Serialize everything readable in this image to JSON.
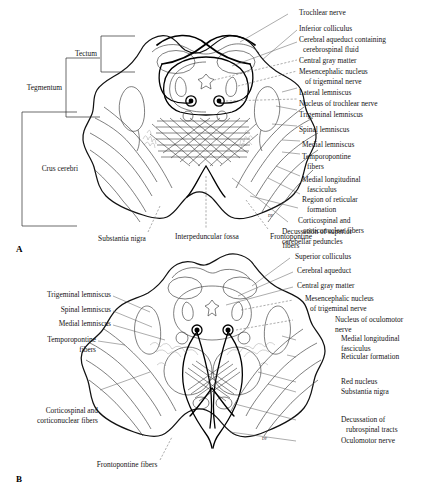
{
  "figure": {
    "panels": [
      {
        "marker": "A",
        "caption": "Midbrain at the level of the inferior colliculus",
        "brackets": [
          {
            "name": "tectum",
            "label": "Tectum"
          },
          {
            "name": "tegmentum",
            "label": "Tegmentum"
          },
          {
            "name": "crus-cerebri",
            "label": "Crus cerebri"
          }
        ],
        "labels_right": [
          "Trochlear nerve",
          "Inferior colliculus",
          "Cerebral aqueduct containing",
          "cerebrospinal fluid",
          "Central gray matter",
          "Mesencephalic nucleus",
          "of trigeminal nerve",
          "Lateral lemniscus",
          "Nucleus of trochlear nerve",
          "Trigeminal lemniscus",
          "Spinal lemniscus",
          "Medial lemniscus",
          "Temporopontine",
          "fibers",
          "Medial longitudinal",
          "fasciculus",
          "Region of reticular",
          "formation",
          "Corticospinal and",
          "corticonuclear fibers",
          "Decussation of superior",
          "cerebellar peduncles"
        ],
        "labels_bottom": [
          "Substantia nigra",
          "Interpeduncular fossa",
          "Frontopontine",
          "fibers"
        ],
        "inline_abbrev": "DF"
      },
      {
        "marker": "B",
        "caption": "Midbrain at the level of the superior colliculus",
        "labels_left": [
          "Trigeminal lemniscus",
          "Spinal lemniscus",
          "Medial lemniscus",
          "Temporopontine",
          "fibers",
          "Corticospinal and",
          "corticonuclear fibers"
        ],
        "labels_right": [
          "Superior colliculus",
          "Cerebral aqueduct",
          "Central gray matter",
          "Mesencephalic nucleus",
          "of trigeminal nerve",
          "Nucleus of oculomotor",
          "nerve",
          "Medial longitudinal",
          "fasciculus",
          "Reticular formation",
          "Red nucleus",
          "Substantia nigra",
          "Decussation of",
          "rubrospinal tracts",
          "Oculomotor nerve"
        ],
        "labels_bottom": [
          "Frontopontine fibers"
        ],
        "inline_abbrev": "DF"
      }
    ],
    "colors": {
      "ink": "#111111",
      "leader": "#5a5a5a",
      "page": "#ffffff",
      "reticular": "#9a9a9a"
    }
  },
  "panel_a": {
    "marker": "A",
    "bracket_tectum": "Tectum",
    "bracket_tegmentum": "Tegmentum",
    "bracket_crus": "Crus cerebri",
    "r1": "Trochlear nerve",
    "r2": "Inferior colliculus",
    "r3a": "Cerebral aqueduct containing",
    "r3b": "cerebrospinal fluid",
    "r4": "Central gray matter",
    "r5a": "Mesencephalic nucleus",
    "r5b": "of trigeminal nerve",
    "r6": "Lateral lemniscus",
    "r7": "Nucleus of trochlear nerve",
    "r8": "Trigeminal lemniscus",
    "r9": "Spinal lemniscus",
    "r10": "Medial lemniscus",
    "r11a": "Temporopontine",
    "r11b": "fibers",
    "r12a": "Medial longitudinal",
    "r12b": "fasciculus",
    "r13a": "Region of reticular",
    "r13b": "formation",
    "r14a": "Corticospinal and",
    "r14b": "corticonuclear fibers",
    "r15a": "Decussation of superior",
    "r15b": "cerebellar peduncles",
    "b1": "Substantia nigra",
    "b2": "Interpeduncular fossa",
    "b3a": "Frontopontine",
    "b3b": "fibers",
    "df": "DF"
  },
  "panel_b": {
    "marker": "B",
    "l1": "Trigeminal lemniscus",
    "l2": "Spinal lemniscus",
    "l3": "Medial lemniscus",
    "l4a": "Temporopontine",
    "l4b": "fibers",
    "l5a": "Corticospinal and",
    "l5b": "corticonuclear fibers",
    "r1": "Superior colliculus",
    "r2": "Cerebral aqueduct",
    "r3": "Central gray matter",
    "r4a": "Mesencephalic nucleus",
    "r4b": "of trigeminal nerve",
    "r5a": "Nucleus of oculomotor",
    "r5b": "nerve",
    "r6a": "Medial longitudinal",
    "r6b": "fasciculus",
    "r7": "Reticular formation",
    "r8": "Red nucleus",
    "r9": "Substantia nigra",
    "r10a": "Decussation of",
    "r10b": "rubrospinal tracts",
    "r11": "Oculomotor nerve",
    "b1": "Frontopontine fibers",
    "df": "DF"
  }
}
